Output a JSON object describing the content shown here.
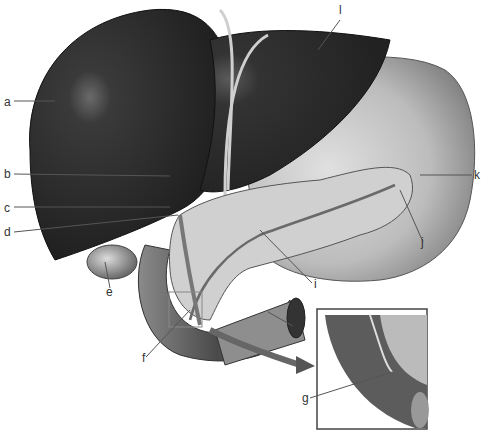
{
  "diagram": {
    "type": "anatomical-illustration",
    "palette": {
      "liver": "#2a2a2a",
      "stomach": "#9a9a9a",
      "pancreas": "#c8c8c8",
      "duodenum": "#5a5a5a",
      "leader_line": "#555555",
      "label_text": "#333333",
      "background": "#ffffff"
    },
    "labels": [
      {
        "id": "a",
        "text": "a",
        "x": 4,
        "y": 96
      },
      {
        "id": "b",
        "text": "b",
        "x": 4,
        "y": 168
      },
      {
        "id": "c",
        "text": "c",
        "x": 4,
        "y": 202
      },
      {
        "id": "d",
        "text": "d",
        "x": 4,
        "y": 228
      },
      {
        "id": "e",
        "text": "e",
        "x": 106,
        "y": 284
      },
      {
        "id": "f",
        "text": "f",
        "x": 142,
        "y": 352
      },
      {
        "id": "g",
        "text": "g",
        "x": 304,
        "y": 394
      },
      {
        "id": "h",
        "text": "h",
        "x": 295,
        "y": 322
      },
      {
        "id": "i",
        "text": "i",
        "x": 314,
        "y": 280
      },
      {
        "id": "j",
        "text": "j",
        "x": 421,
        "y": 238
      },
      {
        "id": "k",
        "text": "k",
        "x": 475,
        "y": 170
      },
      {
        "id": "l",
        "text": "l",
        "x": 340,
        "y": 8
      }
    ]
  }
}
